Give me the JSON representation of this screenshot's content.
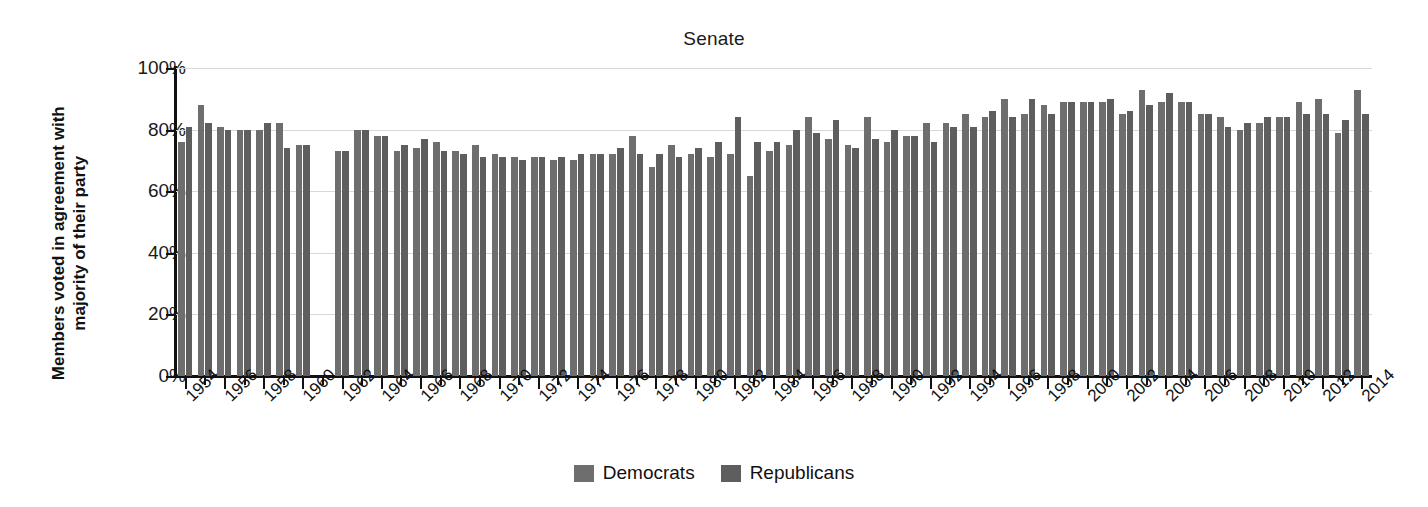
{
  "chart_data": {
    "type": "bar",
    "title": "Senate",
    "xlabel": "",
    "ylabel": "Members voted in agreement with majority of their party",
    "ylim": [
      0,
      100
    ],
    "ytick_labels": [
      "0%",
      "20%",
      "40%",
      "60%",
      "80%",
      "100%"
    ],
    "ytick_values": [
      0,
      20,
      40,
      60,
      80,
      100
    ],
    "grid": true,
    "legend_position": "bottom",
    "x_tick_labels": [
      "1954",
      "1956",
      "1958",
      "1960",
      "1962",
      "1964",
      "1966",
      "1968",
      "1970",
      "1972",
      "1974",
      "1976",
      "1978",
      "1980",
      "1982",
      "1984",
      "1986",
      "1988",
      "1990",
      "1992",
      "1994",
      "1996",
      "1998",
      "2000",
      "2002",
      "2004",
      "2006",
      "2008",
      "2010",
      "2012",
      "2014"
    ],
    "x_tick_years": [
      1954,
      1956,
      1958,
      1960,
      1962,
      1964,
      1966,
      1968,
      1970,
      1972,
      1974,
      1976,
      1978,
      1980,
      1982,
      1984,
      1986,
      1988,
      1990,
      1992,
      1994,
      1996,
      1998,
      2000,
      2002,
      2004,
      2006,
      2008,
      2010,
      2012,
      2014
    ],
    "x": [
      1954,
      1955,
      1956,
      1957,
      1958,
      1959,
      1960,
      1962,
      1963,
      1964,
      1965,
      1966,
      1967,
      1968,
      1969,
      1970,
      1971,
      1972,
      1973,
      1974,
      1975,
      1976,
      1977,
      1978,
      1979,
      1980,
      1981,
      1982,
      1983,
      1984,
      1985,
      1986,
      1987,
      1988,
      1989,
      1990,
      1991,
      1992,
      1993,
      1994,
      1995,
      1996,
      1997,
      1998,
      1999,
      2000,
      2001,
      2002,
      2003,
      2004,
      2005,
      2006,
      2007,
      2008,
      2009,
      2010,
      2011,
      2012,
      2013,
      2014
    ],
    "missing_years": [
      1961
    ],
    "series": [
      {
        "name": "Democrats",
        "color": "#6e6e6e",
        "values": [
          76,
          88,
          81,
          80,
          80,
          82,
          75,
          73,
          80,
          78,
          73,
          74,
          76,
          73,
          75,
          72,
          71,
          71,
          70,
          70,
          72,
          72,
          78,
          68,
          75,
          72,
          71,
          72,
          65,
          73,
          75,
          84,
          77,
          75,
          84,
          76,
          78,
          82,
          82,
          85,
          84,
          90,
          85,
          88,
          89,
          89,
          89,
          85,
          93,
          89,
          89,
          85,
          84,
          80,
          82,
          84,
          89,
          90,
          79,
          93
        ],
        "note": "Left bar of each annual pair"
      },
      {
        "name": "Republicans",
        "color": "#5e5e5e",
        "values": [
          81,
          82,
          80,
          80,
          82,
          74,
          75,
          73,
          80,
          78,
          75,
          77,
          73,
          72,
          71,
          71,
          70,
          71,
          71,
          72,
          72,
          74,
          72,
          72,
          71,
          74,
          76,
          84,
          76,
          76,
          80,
          79,
          83,
          74,
          77,
          80,
          78,
          76,
          81,
          81,
          86,
          84,
          90,
          85,
          89,
          89,
          90,
          86,
          88,
          92,
          89,
          85,
          81,
          82,
          84,
          84,
          85,
          85,
          83,
          85
        ],
        "note": "Right bar of each annual pair"
      }
    ]
  },
  "legend": {
    "items": [
      {
        "label": "Democrats",
        "color": "#6e6e6e"
      },
      {
        "label": "Republicans",
        "color": "#5e5e5e"
      }
    ]
  }
}
